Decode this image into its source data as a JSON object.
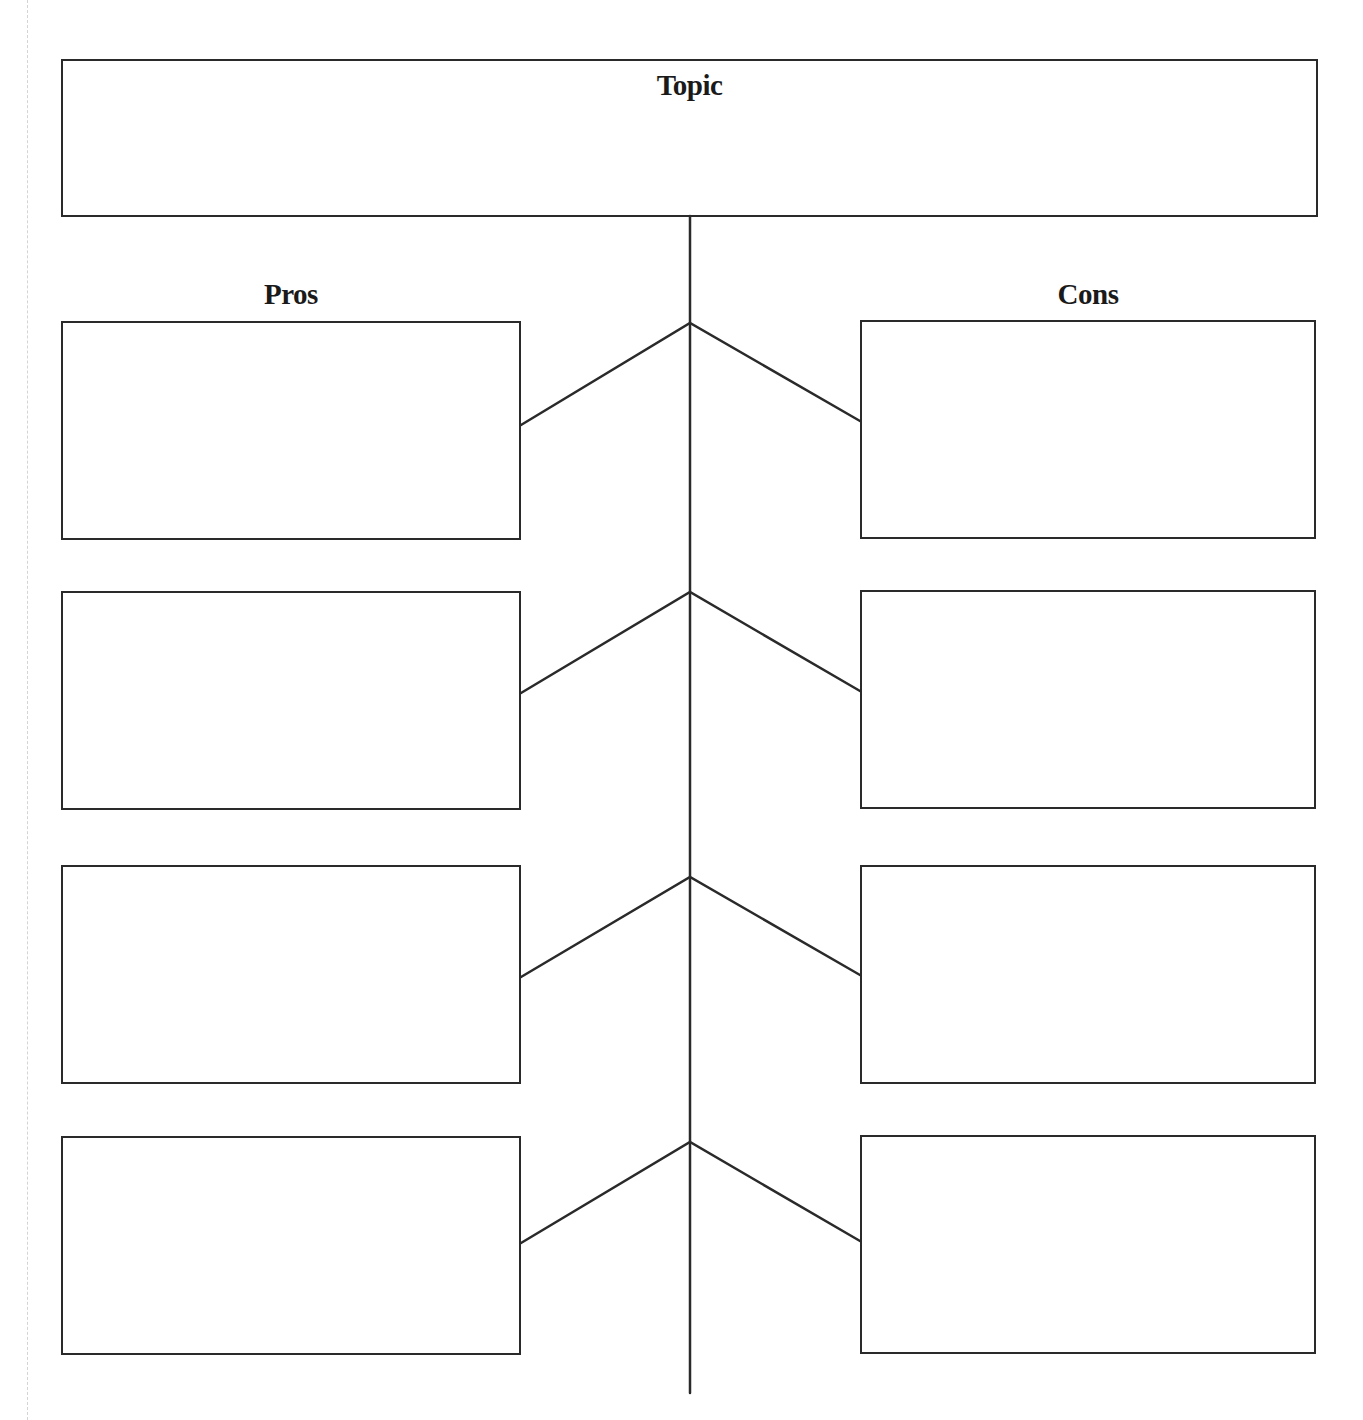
{
  "diagram": {
    "type": "pros-cons-graphic-organizer",
    "topic": {
      "label": "Topic",
      "content": ""
    },
    "columns": {
      "pros": {
        "label": "Pros",
        "boxes": [
          {
            "index": 1,
            "content": ""
          },
          {
            "index": 2,
            "content": ""
          },
          {
            "index": 3,
            "content": ""
          },
          {
            "index": 4,
            "content": ""
          }
        ]
      },
      "cons": {
        "label": "Cons",
        "boxes": [
          {
            "index": 1,
            "content": ""
          },
          {
            "index": 2,
            "content": ""
          },
          {
            "index": 3,
            "content": ""
          },
          {
            "index": 4,
            "content": ""
          }
        ]
      }
    },
    "colors": {
      "line": "#2a2a2a",
      "background": "#ffffff",
      "margin_guide": "#d4d4d4"
    }
  }
}
